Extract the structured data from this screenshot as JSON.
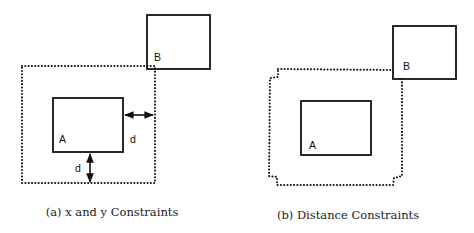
{
  "figure": {
    "panel_a": {
      "box_a_label": "A",
      "box_b_label": "B",
      "distance_label_horizontal": "d",
      "distance_label_vertical": "d",
      "caption": "(a) x and y Constraints"
    },
    "panel_b": {
      "box_a_label": "A",
      "box_b_label": "B",
      "caption": "(b) Distance Constraints"
    },
    "colors": {
      "stroke": "#111111",
      "background": "#ffffff"
    }
  }
}
